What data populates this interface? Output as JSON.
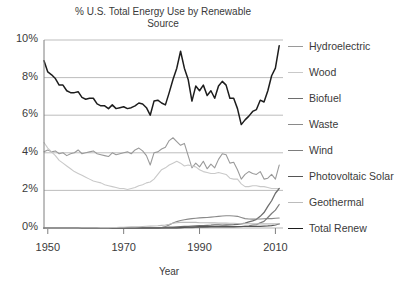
{
  "chart_data": {
    "type": "line",
    "title": "% U.S. Total Energy Use by Renewable\nSource",
    "xlabel": "Year",
    "ylabel": "",
    "xlim": [
      1949,
      2012
    ],
    "ylim": [
      0,
      10
    ],
    "grid": true,
    "legend_position": "right",
    "xticks": [
      "1950",
      "1970",
      "1990",
      "2010"
    ],
    "xtick_values": [
      1950,
      1970,
      1990,
      2010
    ],
    "yticks": [
      "0%",
      "2%",
      "4%",
      "6%",
      "8%",
      "10%"
    ],
    "ytick_values": [
      0,
      2,
      4,
      6,
      8,
      10
    ],
    "x": [
      1949,
      1950,
      1951,
      1952,
      1953,
      1954,
      1955,
      1956,
      1957,
      1958,
      1959,
      1960,
      1961,
      1962,
      1963,
      1964,
      1965,
      1966,
      1967,
      1968,
      1969,
      1970,
      1971,
      1972,
      1973,
      1974,
      1975,
      1976,
      1977,
      1978,
      1979,
      1980,
      1981,
      1982,
      1983,
      1984,
      1985,
      1986,
      1987,
      1988,
      1989,
      1990,
      1991,
      1992,
      1993,
      1994,
      1995,
      1996,
      1997,
      1998,
      1999,
      2000,
      2001,
      2002,
      2003,
      2004,
      2005,
      2006,
      2007,
      2008,
      2009,
      2010,
      2011
    ],
    "series": [
      {
        "name": "Hydroelectric",
        "color": "#9a9a9a",
        "width": 1.1,
        "values": [
          4.05,
          4.15,
          4.05,
          4.1,
          3.95,
          4.0,
          3.85,
          3.95,
          4.0,
          4.15,
          3.95,
          4.0,
          4.05,
          4.1,
          3.95,
          3.9,
          3.85,
          3.8,
          4.0,
          3.9,
          3.95,
          4.0,
          4.05,
          3.95,
          4.15,
          4.25,
          4.1,
          3.85,
          3.35,
          4.0,
          4.05,
          4.2,
          4.3,
          4.65,
          4.8,
          4.6,
          4.4,
          4.5,
          3.85,
          3.2,
          3.45,
          3.25,
          3.55,
          3.15,
          3.4,
          3.2,
          3.65,
          3.95,
          3.9,
          3.45,
          3.5,
          3.1,
          2.6,
          2.85,
          3.0,
          2.9,
          2.85,
          3.0,
          2.6,
          2.65,
          2.85,
          2.6,
          3.35
        ]
      },
      {
        "name": "Wood",
        "color": "#c9c9c9",
        "width": 1.1,
        "values": [
          4.55,
          4.25,
          4.05,
          3.85,
          3.6,
          3.45,
          3.3,
          3.15,
          3.0,
          2.9,
          2.8,
          2.7,
          2.6,
          2.5,
          2.45,
          2.4,
          2.3,
          2.25,
          2.2,
          2.15,
          2.1,
          2.1,
          2.05,
          2.1,
          2.15,
          2.25,
          2.3,
          2.4,
          2.45,
          2.6,
          2.85,
          3.1,
          3.2,
          3.35,
          3.45,
          3.55,
          3.45,
          3.3,
          3.35,
          3.3,
          3.25,
          3.1,
          3.0,
          2.95,
          2.9,
          2.9,
          2.95,
          2.9,
          2.85,
          2.65,
          2.6,
          2.6,
          2.35,
          2.2,
          2.2,
          2.25,
          2.25,
          2.2,
          2.2,
          2.15,
          2.1,
          2.1,
          2.1
        ]
      },
      {
        "name": "Biofuel",
        "color": "#6e6e6e",
        "width": 1.3,
        "values": [
          0,
          0,
          0,
          0,
          0,
          0,
          0,
          0,
          0,
          0,
          0,
          0,
          0,
          0,
          0,
          0,
          0,
          0,
          0,
          0,
          0,
          0,
          0,
          0,
          0,
          0,
          0,
          0,
          0,
          0,
          0,
          0.02,
          0.03,
          0.04,
          0.05,
          0.06,
          0.07,
          0.08,
          0.09,
          0.1,
          0.11,
          0.12,
          0.13,
          0.14,
          0.15,
          0.17,
          0.17,
          0.15,
          0.16,
          0.17,
          0.18,
          0.2,
          0.22,
          0.26,
          0.32,
          0.38,
          0.46,
          0.62,
          0.82,
          1.15,
          1.45,
          1.85,
          2.1
        ]
      },
      {
        "name": "Waste",
        "color": "#8a8a8a",
        "width": 1.1,
        "values": [
          0,
          0,
          0,
          0,
          0,
          0,
          0,
          0,
          0,
          0,
          0,
          0,
          0,
          0,
          0,
          0,
          0,
          0,
          0,
          0,
          0,
          0,
          0,
          0,
          0,
          0,
          0,
          0,
          0,
          0,
          0,
          0.03,
          0.08,
          0.16,
          0.26,
          0.34,
          0.4,
          0.44,
          0.47,
          0.5,
          0.52,
          0.54,
          0.55,
          0.56,
          0.58,
          0.6,
          0.62,
          0.64,
          0.65,
          0.65,
          0.64,
          0.62,
          0.56,
          0.5,
          0.48,
          0.47,
          0.48,
          0.48,
          0.49,
          0.5,
          0.5,
          0.52,
          0.53
        ]
      },
      {
        "name": "Wind",
        "color": "#7d7d7d",
        "width": 1.2,
        "values": [
          0,
          0,
          0,
          0,
          0,
          0,
          0,
          0,
          0,
          0,
          0,
          0,
          0,
          0,
          0,
          0,
          0,
          0,
          0,
          0,
          0,
          0,
          0,
          0,
          0,
          0,
          0,
          0,
          0,
          0,
          0,
          0,
          0,
          0,
          0.01,
          0.01,
          0.01,
          0.02,
          0.02,
          0.02,
          0.03,
          0.03,
          0.03,
          0.03,
          0.04,
          0.04,
          0.04,
          0.04,
          0.04,
          0.05,
          0.05,
          0.06,
          0.07,
          0.1,
          0.12,
          0.15,
          0.18,
          0.27,
          0.35,
          0.56,
          0.77,
          0.95,
          1.25
        ]
      },
      {
        "name": "Photovoltaic Solar",
        "color": "#555555",
        "width": 1.2,
        "values": [
          0,
          0,
          0,
          0,
          0,
          0,
          0,
          0,
          0,
          0,
          0,
          0,
          0,
          0,
          0,
          0,
          0,
          0,
          0,
          0,
          0,
          0,
          0,
          0,
          0,
          0,
          0,
          0,
          0,
          0,
          0,
          0,
          0,
          0,
          0.01,
          0.01,
          0.02,
          0.03,
          0.04,
          0.05,
          0.06,
          0.07,
          0.07,
          0.08,
          0.08,
          0.08,
          0.08,
          0.08,
          0.08,
          0.08,
          0.08,
          0.08,
          0.08,
          0.08,
          0.08,
          0.08,
          0.09,
          0.09,
          0.1,
          0.11,
          0.13,
          0.16,
          0.22
        ]
      },
      {
        "name": "Geothermal",
        "color": "#bcbcbc",
        "width": 1.1,
        "values": [
          0,
          0,
          0,
          0,
          0,
          0,
          0,
          0,
          0,
          0,
          0.01,
          0.01,
          0.01,
          0.01,
          0.01,
          0.02,
          0.02,
          0.02,
          0.03,
          0.03,
          0.04,
          0.04,
          0.05,
          0.06,
          0.06,
          0.07,
          0.08,
          0.09,
          0.1,
          0.11,
          0.12,
          0.14,
          0.16,
          0.2,
          0.25,
          0.28,
          0.3,
          0.3,
          0.3,
          0.3,
          0.3,
          0.28,
          0.28,
          0.28,
          0.27,
          0.27,
          0.26,
          0.26,
          0.26,
          0.25,
          0.25,
          0.24,
          0.23,
          0.23,
          0.23,
          0.22,
          0.22,
          0.22,
          0.22,
          0.22,
          0.22,
          0.22,
          0.22
        ]
      },
      {
        "name": "Total Renew",
        "color": "#1d1d1d",
        "width": 1.5,
        "values": [
          8.9,
          8.3,
          8.15,
          7.95,
          7.6,
          7.6,
          7.3,
          7.2,
          7.2,
          7.25,
          6.95,
          6.85,
          6.9,
          6.9,
          6.6,
          6.5,
          6.5,
          6.35,
          6.55,
          6.35,
          6.4,
          6.45,
          6.35,
          6.4,
          6.5,
          6.65,
          6.6,
          6.4,
          6.0,
          6.75,
          6.8,
          6.65,
          6.55,
          7.2,
          7.9,
          8.5,
          9.4,
          8.5,
          7.9,
          6.75,
          7.55,
          7.3,
          7.6,
          7.05,
          7.3,
          6.9,
          7.55,
          7.8,
          7.6,
          6.9,
          6.9,
          6.35,
          5.5,
          5.75,
          5.95,
          6.2,
          6.3,
          6.8,
          6.7,
          7.3,
          8.1,
          8.5,
          9.7
        ]
      }
    ]
  },
  "legend": {
    "items": [
      {
        "label": "Hydroelectric",
        "color": "#9a9a9a",
        "width": 1.1
      },
      {
        "label": "Wood",
        "color": "#c9c9c9",
        "width": 1.1
      },
      {
        "label": "Biofuel",
        "color": "#6e6e6e",
        "width": 1.5
      },
      {
        "label": "Waste",
        "color": "#8a8a8a",
        "width": 1.1
      },
      {
        "label": "Wind",
        "color": "#7d7d7d",
        "width": 1.2
      },
      {
        "label": "Photovoltaic Solar",
        "color": "#555555",
        "width": 1.6
      },
      {
        "label": "Geothermal",
        "color": "#bcbcbc",
        "width": 1.1
      },
      {
        "label": "Total Renew",
        "color": "#1d1d1d",
        "width": 1.8
      }
    ]
  },
  "axes": {
    "grid_color": "#b5b5b5",
    "axis_color": "#7f7f7f",
    "text_color": "#3a3a3a"
  }
}
